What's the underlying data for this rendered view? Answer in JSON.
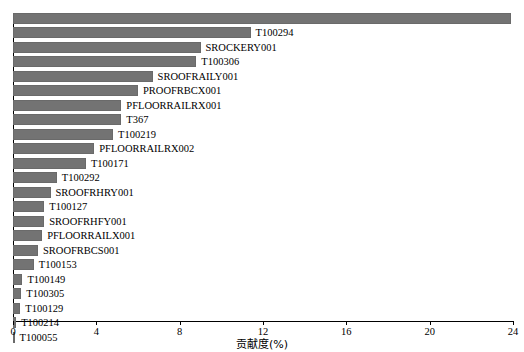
{
  "chart_data": {
    "type": "bar",
    "orientation": "horizontal",
    "title": "",
    "xlabel": "贡献度(%)",
    "ylabel": "",
    "xlim": [
      0,
      24
    ],
    "xticks": [
      0,
      4,
      8,
      12,
      16,
      20,
      24
    ],
    "xtick_labels": [
      "0",
      "4",
      "8",
      "12",
      "16",
      "20",
      "24"
    ],
    "grid": false,
    "legend": null,
    "bar_color": "#737373",
    "categories": [
      "",
      "T100294",
      "SROCKERY001",
      "T100306",
      "SROOFRAILY001",
      "PROOFRBCX001",
      "PFLOORRAILRX001",
      "T367",
      "T100219",
      "PFLOORRAILRX002",
      "T100171",
      "T100292",
      "SROOFRHRY001",
      "T100127",
      "SROOFRHFY001",
      "PFLOORRAILX001",
      "SROOFRBCS001",
      "T100153",
      "T100149",
      "T100305",
      "T100129",
      "T100214",
      "T100055"
    ],
    "values": [
      23.9,
      11.4,
      9.0,
      8.8,
      6.7,
      6.0,
      5.2,
      5.2,
      4.8,
      3.9,
      3.5,
      2.1,
      1.8,
      1.5,
      1.5,
      1.4,
      1.2,
      1.0,
      0.45,
      0.4,
      0.35,
      0.15,
      0.05
    ]
  }
}
